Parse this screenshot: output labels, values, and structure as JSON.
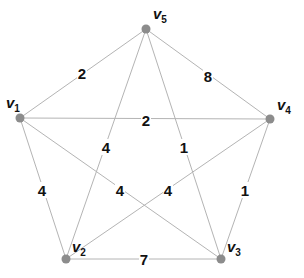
{
  "graph": {
    "vertices": [
      {
        "id": "v1",
        "label": "v",
        "sub": "1",
        "x": 20,
        "y": 118,
        "lx": 6,
        "ly": 108
      },
      {
        "id": "v2",
        "label": "v",
        "sub": "2",
        "x": 66,
        "y": 259,
        "lx": 72,
        "ly": 252
      },
      {
        "id": "v3",
        "label": "v",
        "sub": "3",
        "x": 221,
        "y": 259,
        "lx": 227,
        "ly": 252
      },
      {
        "id": "v4",
        "label": "v",
        "sub": "4",
        "x": 270,
        "y": 119,
        "lx": 277,
        "ly": 110
      },
      {
        "id": "v5",
        "label": "v",
        "sub": "5",
        "x": 146,
        "y": 29,
        "lx": 153,
        "ly": 19
      }
    ],
    "edges": [
      {
        "from": "v1",
        "to": "v5",
        "weight": "2",
        "lx": 82,
        "ly": 73
      },
      {
        "from": "v5",
        "to": "v4",
        "weight": "8",
        "lx": 208,
        "ly": 76
      },
      {
        "from": "v1",
        "to": "v4",
        "weight": "2",
        "lx": 146,
        "ly": 120
      },
      {
        "from": "v5",
        "to": "v2",
        "weight": "4",
        "lx": 106,
        "ly": 147
      },
      {
        "from": "v5",
        "to": "v3",
        "weight": "1",
        "lx": 184,
        "ly": 147
      },
      {
        "from": "v1",
        "to": "v2",
        "weight": "4",
        "lx": 42,
        "ly": 190
      },
      {
        "from": "v1",
        "to": "v3",
        "weight": "4",
        "lx": 120,
        "ly": 190
      },
      {
        "from": "v4",
        "to": "v2",
        "weight": "4",
        "lx": 168,
        "ly": 190
      },
      {
        "from": "v4",
        "to": "v3",
        "weight": "1",
        "lx": 245,
        "ly": 190
      },
      {
        "from": "v2",
        "to": "v3",
        "weight": "7",
        "lx": 144,
        "ly": 259
      }
    ]
  },
  "colors": {
    "edge": "#b4b4b4",
    "vertex": "#8c8c8c",
    "text": "#111111",
    "background": "#ffffff"
  }
}
